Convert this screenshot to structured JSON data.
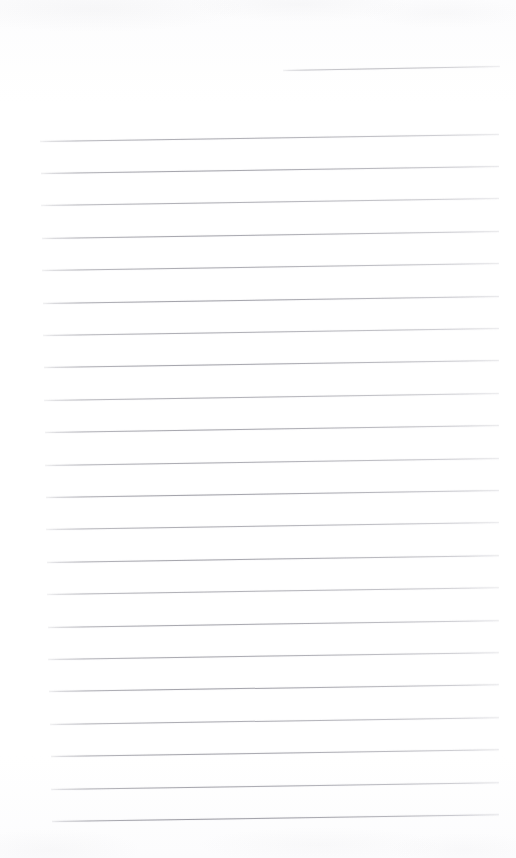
{
  "document": {
    "kind": "scanned-lined-notepad-page",
    "title": "Blank lined notepad page",
    "visible_text": "",
    "page_width": 516,
    "page_height": 858,
    "background_color": "#fdfdfd",
    "rule_color": "#8a8a93",
    "rule_thickness_px": 1,
    "rule_spacing_px": 32.4,
    "rule_slope_px_over_width": -7,
    "rule_count_total": 23,
    "notes": "No handwriting, no printed text, no headers. Only the printed ruling of the paper is visible."
  },
  "header_rule": {
    "name": "date-line",
    "x": 283,
    "y": 70,
    "width": 217,
    "rotation_deg": -1.05,
    "opacity": 0.62
  },
  "body_rules": [
    {
      "x": 40,
      "y": 140.5,
      "width": 459,
      "rotation_deg": -0.87,
      "opacity": 0.72
    },
    {
      "x": 41,
      "y": 172.9,
      "width": 458,
      "rotation_deg": -0.87,
      "opacity": 0.8
    },
    {
      "x": 41,
      "y": 205.3,
      "width": 458,
      "rotation_deg": -0.87,
      "opacity": 0.7
    },
    {
      "x": 42,
      "y": 237.7,
      "width": 457,
      "rotation_deg": -0.87,
      "opacity": 0.78
    },
    {
      "x": 42,
      "y": 270.1,
      "width": 457,
      "rotation_deg": -0.87,
      "opacity": 0.74
    },
    {
      "x": 43,
      "y": 302.5,
      "width": 456,
      "rotation_deg": -0.87,
      "opacity": 0.82
    },
    {
      "x": 43,
      "y": 334.9,
      "width": 456,
      "rotation_deg": -0.87,
      "opacity": 0.72
    },
    {
      "x": 44,
      "y": 367.3,
      "width": 455,
      "rotation_deg": -0.87,
      "opacity": 0.8
    },
    {
      "x": 44,
      "y": 399.7,
      "width": 455,
      "rotation_deg": -0.87,
      "opacity": 0.7
    },
    {
      "x": 45,
      "y": 432.1,
      "width": 454,
      "rotation_deg": -0.87,
      "opacity": 0.78
    },
    {
      "x": 45,
      "y": 464.5,
      "width": 454,
      "rotation_deg": -0.87,
      "opacity": 0.74
    },
    {
      "x": 46,
      "y": 496.9,
      "width": 453,
      "rotation_deg": -0.87,
      "opacity": 0.82
    },
    {
      "x": 46,
      "y": 529.3,
      "width": 453,
      "rotation_deg": -0.87,
      "opacity": 0.72
    },
    {
      "x": 47,
      "y": 561.7,
      "width": 452,
      "rotation_deg": -0.87,
      "opacity": 0.8
    },
    {
      "x": 47,
      "y": 594.1,
      "width": 452,
      "rotation_deg": -0.87,
      "opacity": 0.7
    },
    {
      "x": 48,
      "y": 626.5,
      "width": 451,
      "rotation_deg": -0.87,
      "opacity": 0.78
    },
    {
      "x": 48,
      "y": 658.9,
      "width": 451,
      "rotation_deg": -0.87,
      "opacity": 0.76
    },
    {
      "x": 49,
      "y": 691.3,
      "width": 450,
      "rotation_deg": -0.87,
      "opacity": 0.82
    },
    {
      "x": 50,
      "y": 723.7,
      "width": 449,
      "rotation_deg": -0.87,
      "opacity": 0.74
    },
    {
      "x": 51,
      "y": 756.1,
      "width": 448,
      "rotation_deg": -0.87,
      "opacity": 0.8
    },
    {
      "x": 51,
      "y": 788.5,
      "width": 448,
      "rotation_deg": -0.87,
      "opacity": 0.78
    },
    {
      "x": 52,
      "y": 820.9,
      "width": 447,
      "rotation_deg": -0.87,
      "opacity": 0.86
    }
  ]
}
